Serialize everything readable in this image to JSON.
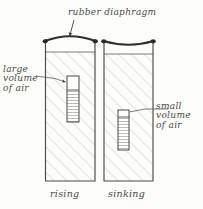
{
  "figure": {
    "kind": "hand-drawn-diagram",
    "title": "rubber diaphragm",
    "background_color": "#fdfdfc",
    "ink_color": "#4a4a48",
    "hatch_color": "#bcbcb8"
  },
  "labels": {
    "large_volume": {
      "line1": "large",
      "line2": "volume",
      "line3": "of air"
    },
    "small_volume": {
      "line1": "small",
      "line2": "volume",
      "line3": "of air"
    }
  },
  "captions": {
    "left": "rising",
    "right": "sinking"
  },
  "jars": [
    {
      "name": "left-jar",
      "caption": "rising",
      "diaphragm_state": "bulging-up",
      "diver_air_volume": "large",
      "diver_position": "upper"
    },
    {
      "name": "right-jar",
      "caption": "sinking",
      "diaphragm_state": "pressed-down",
      "diver_air_volume": "small",
      "diver_position": "middle"
    }
  ]
}
